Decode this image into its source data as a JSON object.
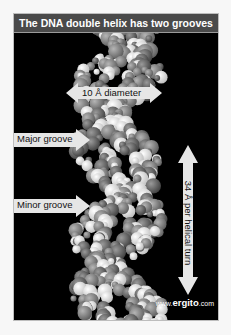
{
  "figure": {
    "title": "The DNA double helix has two grooves",
    "labels": {
      "diameter": "10 Å diameter",
      "major_groove": "Major groove",
      "minor_groove": "Minor groove",
      "helical_turn": "34 Å per helical turn"
    },
    "watermark": {
      "prefix": "www.",
      "brand": "ergito",
      "suffix": ".com"
    },
    "colors": {
      "title_bar": "#4a4a4a",
      "background": "#000000",
      "arrow_fill": "#e6e6e6",
      "atom_light": "#f2f2f2",
      "atom_mid": "#8a8a8a",
      "atom_dark": "#5a5a5a"
    }
  }
}
